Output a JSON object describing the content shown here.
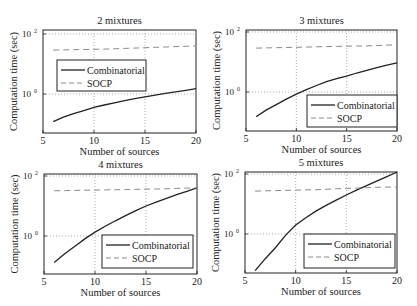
{
  "chart_data": [
    {
      "type": "line",
      "title": "2 mixtures",
      "xlabel": "Number of sources",
      "ylabel": "Computation time (sec)",
      "yscale": "log",
      "xlim": [
        5,
        20
      ],
      "ylim_log10": [
        -1.3,
        2.1
      ],
      "xticks": [
        5,
        10,
        15,
        20
      ],
      "yticks": [
        {
          "value": 1,
          "label": "10^0"
        },
        {
          "value": 100,
          "label": "10^2"
        }
      ],
      "grid": true,
      "legend_position": "center-left",
      "x": [
        6,
        7,
        8,
        9,
        10,
        11,
        12,
        13,
        14,
        15,
        16,
        17,
        18,
        19,
        20
      ],
      "series": [
        {
          "name": "Combinatorial",
          "style": "solid",
          "values": [
            0.12,
            0.17,
            0.22,
            0.28,
            0.36,
            0.43,
            0.51,
            0.6,
            0.7,
            0.8,
            0.92,
            1.05,
            1.18,
            1.33,
            1.5
          ]
        },
        {
          "name": "SOCP",
          "style": "dashed",
          "values": [
            29,
            29.5,
            30,
            30.5,
            31,
            31.5,
            32,
            33,
            34,
            35,
            36,
            37,
            38,
            39,
            40
          ]
        }
      ]
    },
    {
      "type": "line",
      "title": "3 mixtures",
      "xlabel": "Number of sources",
      "ylabel": "Computation time (sec)",
      "yscale": "log",
      "xlim": [
        5,
        20
      ],
      "ylim_log10": [
        -1.3,
        2.1
      ],
      "xticks": [
        5,
        10,
        15,
        20
      ],
      "yticks": [
        {
          "value": 1,
          "label": "10^0"
        },
        {
          "value": 100,
          "label": "10^2"
        }
      ],
      "grid": true,
      "legend_position": "lower-right",
      "x": [
        6,
        7,
        8,
        9,
        10,
        11,
        12,
        13,
        14,
        15,
        16,
        17,
        18,
        19,
        20
      ],
      "series": [
        {
          "name": "Combinatorial",
          "style": "solid",
          "values": [
            0.15,
            0.25,
            0.38,
            0.58,
            0.85,
            1.2,
            1.65,
            2.2,
            2.8,
            3.4,
            4.3,
            5.3,
            6.5,
            7.8,
            9.3
          ]
        },
        {
          "name": "SOCP",
          "style": "dashed",
          "values": [
            29,
            29.5,
            30,
            30.5,
            31,
            31.5,
            32,
            32.5,
            33,
            33.5,
            34,
            34.5,
            35.5,
            36.5,
            37
          ]
        }
      ]
    },
    {
      "type": "line",
      "title": "4 mixtures",
      "xlabel": "Number of sources",
      "ylabel": "Computation time (sec)",
      "yscale": "log",
      "xlim": [
        5,
        20
      ],
      "ylim_log10": [
        -1.3,
        2.1
      ],
      "xticks": [
        5,
        10,
        15,
        20
      ],
      "yticks": [
        {
          "value": 1,
          "label": "10^0"
        },
        {
          "value": 100,
          "label": "10^2"
        }
      ],
      "grid": true,
      "legend_position": "lower-right",
      "x": [
        6,
        7,
        8,
        9,
        10,
        11,
        12,
        13,
        14,
        15,
        16,
        17,
        18,
        19,
        20
      ],
      "series": [
        {
          "name": "Combinatorial",
          "style": "solid",
          "values": [
            0.13,
            0.25,
            0.45,
            0.8,
            1.35,
            2.1,
            3.2,
            4.8,
            7,
            10,
            13.5,
            18,
            24,
            31,
            40
          ]
        },
        {
          "name": "SOCP",
          "style": "dashed",
          "values": [
            32,
            32.5,
            33,
            33.5,
            34,
            34.5,
            35,
            35.5,
            36,
            36.5,
            37,
            37.5,
            38.5,
            39.5,
            40
          ]
        }
      ]
    },
    {
      "type": "line",
      "title": "5 mixtures",
      "xlabel": "Number of sources",
      "ylabel": "Computation time (sec)",
      "yscale": "log",
      "xlim": [
        5,
        20
      ],
      "ylim_log10": [
        -1.3,
        2.1
      ],
      "xticks": [
        5,
        10,
        15,
        20
      ],
      "yticks": [
        {
          "value": 1,
          "label": "10^0"
        },
        {
          "value": 100,
          "label": "10^2"
        }
      ],
      "grid": true,
      "legend_position": "lower-right",
      "x": [
        6,
        7,
        8,
        9,
        10,
        11,
        12,
        13,
        14,
        15,
        16,
        17,
        18,
        19,
        20
      ],
      "series": [
        {
          "name": "Combinatorial",
          "style": "solid",
          "values": [
            0.06,
            0.15,
            0.35,
            0.9,
            2,
            3.5,
            5.8,
            9,
            13.5,
            20,
            29,
            41,
            58,
            82,
            117
          ]
        },
        {
          "name": "SOCP",
          "style": "dashed",
          "values": [
            27,
            27.5,
            28,
            28.5,
            29,
            29.5,
            30,
            31,
            32,
            33,
            34,
            35,
            36,
            36.5,
            37
          ]
        }
      ]
    }
  ],
  "layout": {
    "panels": [
      {
        "left": 43,
        "top": 30,
        "right": 196,
        "bottom": 133,
        "y_top_decade_px": 34,
        "legend": {
          "x": 57,
          "y": 60,
          "w": 89,
          "h": 31
        }
      },
      {
        "left": 246,
        "top": 30,
        "right": 397,
        "bottom": 131,
        "y_top_decade_px": 32,
        "legend": {
          "x": 307,
          "y": 95,
          "w": 90,
          "h": 32
        }
      },
      {
        "left": 44,
        "top": 174,
        "right": 197,
        "bottom": 274,
        "y_top_decade_px": 176,
        "legend": {
          "x": 102,
          "y": 235,
          "w": 91,
          "h": 33
        }
      },
      {
        "left": 245,
        "top": 172,
        "right": 397,
        "bottom": 273,
        "y_top_decade_px": 174,
        "legend": {
          "x": 304,
          "y": 234,
          "w": 91,
          "h": 34
        }
      }
    ],
    "decade_px": 30,
    "colors": {
      "line": "#222222",
      "dashed": "#8a8a8a",
      "grid": "#9a9a9a",
      "axes": "#222222"
    }
  }
}
